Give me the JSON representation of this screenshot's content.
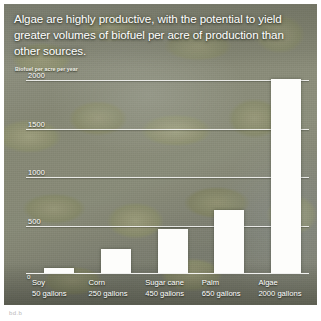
{
  "headline": "Algae are highly productive, with the potential to yield greater volumes of biofuel per acre of production than other sources.",
  "subtitle": "Biofuel per acre per year",
  "caption_mark": "bd.b",
  "colors": {
    "bar": "#fdfdfb",
    "gridline": "#ffffff",
    "text": "#ffffff",
    "photo_base": "#8a8d7a"
  },
  "chart_data": {
    "type": "bar",
    "title": "Algae are highly productive, with the potential to yield greater volumes of biofuel per acre of production than other sources.",
    "subtitle": "Biofuel per acre per year",
    "xlabel": "",
    "ylabel": "Biofuel per acre per year",
    "unit": "gallons",
    "categories": [
      "Soy",
      "Corn",
      "Sugar cane",
      "Palm",
      "Algae"
    ],
    "values": [
      50,
      250,
      450,
      650,
      2000
    ],
    "value_labels": [
      "50 gallons",
      "250 gallons",
      "450 gallons",
      "650 gallons",
      "2000 gallons"
    ],
    "ylim": [
      0,
      2000
    ],
    "yticks": [
      0,
      500,
      1000,
      1500,
      2000
    ],
    "ytick_labels": [
      "0",
      "500",
      "1000",
      "1500",
      "2000"
    ],
    "grid": true,
    "legend": false,
    "background": "photograph of algae cells"
  }
}
